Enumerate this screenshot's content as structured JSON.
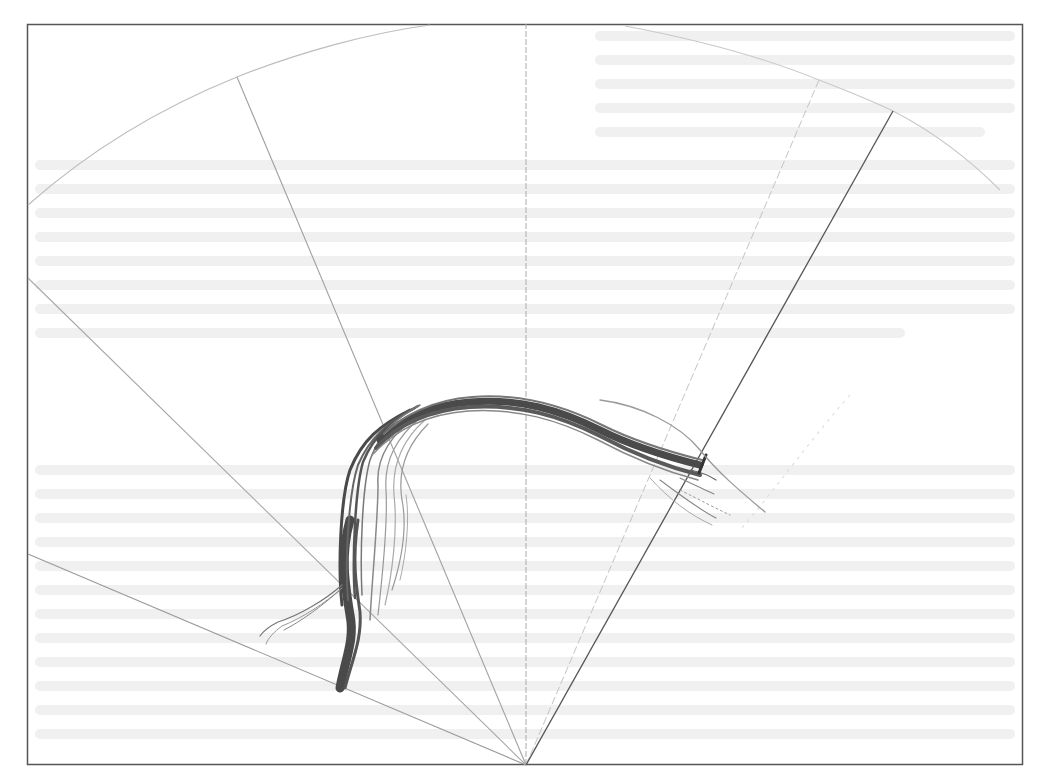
{
  "figure": {
    "frame": {
      "x": 27,
      "y": 24,
      "width": 996,
      "height": 741,
      "stroke": "#555555"
    },
    "apex": {
      "x": 526,
      "y": 765
    },
    "colors": {
      "frame": "#555555",
      "rays": "#9a9a9a",
      "ray_dark": "#555555",
      "arc": "#bdbdbd",
      "bundle": "#4a4a4a",
      "bundle_light": "#8c8c8c",
      "background": "#ffffff"
    },
    "rays": [
      {
        "name": "ray-left-low",
        "x2": 28,
        "y2": 554,
        "style": "solid-light"
      },
      {
        "name": "ray-left-high",
        "x2": 28,
        "y2": 278,
        "style": "solid-light"
      },
      {
        "name": "ray-upper-left",
        "x2": 237,
        "y2": 77,
        "style": "solid-light"
      },
      {
        "name": "ray-center",
        "x2": 526,
        "y2": 24,
        "style": "dashed"
      },
      {
        "name": "ray-right-faint",
        "x2": 819,
        "y2": 80,
        "style": "dashed-light"
      },
      {
        "name": "ray-right-dark",
        "x2": 893,
        "y2": 111,
        "style": "solid-dark"
      }
    ],
    "arc_label": "outer boundary arc",
    "bundle_label": "trajectory bundle"
  }
}
